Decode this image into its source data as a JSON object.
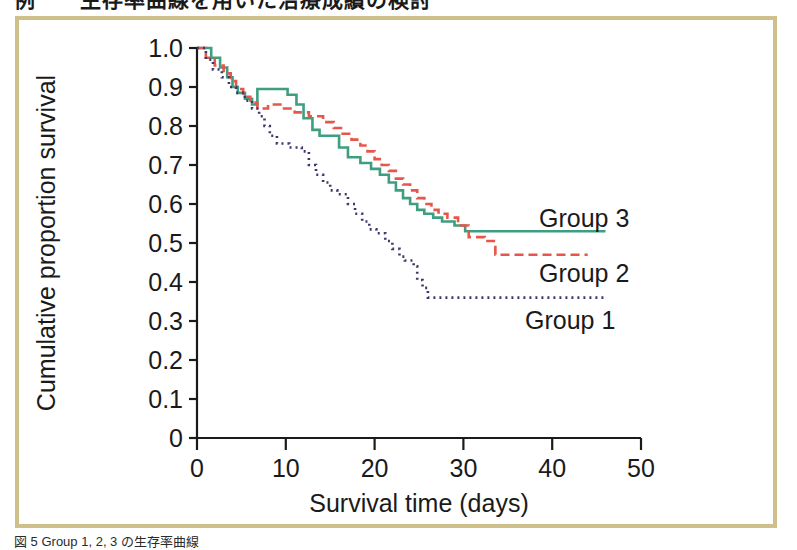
{
  "figure": {
    "top_caption_partial": "例　　生存率曲線を用いた治療成績の検討",
    "bottom_caption_partial": "図 5  Group 1, 2, 3 の生存率曲線",
    "frame_color": "#cfc08b"
  },
  "chart_data": {
    "type": "line",
    "title": "",
    "xlabel": "Survival time (days)",
    "ylabel": "Cumulative proportion survival",
    "xlim": [
      0,
      50
    ],
    "ylim": [
      0,
      1.0
    ],
    "xticks": [
      0,
      10,
      20,
      30,
      40,
      50
    ],
    "xtick_labels": [
      "0",
      "10",
      "20",
      "30",
      "40",
      "50"
    ],
    "yticks": [
      0,
      0.1,
      0.2,
      0.3,
      0.4,
      0.5,
      0.6,
      0.7,
      0.8,
      0.9,
      1.0
    ],
    "ytick_labels": [
      "0",
      "0.1",
      "0.2",
      "0.3",
      "0.4",
      "0.5",
      "0.6",
      "0.7",
      "0.8",
      "0.9",
      "1.0"
    ],
    "grid": false,
    "legend_position": "inline-right",
    "series": [
      {
        "name": "Group 3",
        "label": "Group 3",
        "color": "#3f9e80",
        "style": "solid",
        "stroke_width": 2.6,
        "steps": [
          [
            0.0,
            1.0
          ],
          [
            1.6,
            1.0
          ],
          [
            1.6,
            0.975
          ],
          [
            2.6,
            0.975
          ],
          [
            2.6,
            0.95
          ],
          [
            3.4,
            0.95
          ],
          [
            3.4,
            0.925
          ],
          [
            4.0,
            0.925
          ],
          [
            4.0,
            0.9
          ],
          [
            4.6,
            0.9
          ],
          [
            4.6,
            0.885
          ],
          [
            5.4,
            0.885
          ],
          [
            5.4,
            0.87
          ],
          [
            6.2,
            0.87
          ],
          [
            6.2,
            0.855
          ],
          [
            6.8,
            0.855
          ],
          [
            6.8,
            0.895
          ],
          [
            10.2,
            0.895
          ],
          [
            10.2,
            0.88
          ],
          [
            11.2,
            0.88
          ],
          [
            11.2,
            0.855
          ],
          [
            12.0,
            0.855
          ],
          [
            12.0,
            0.82
          ],
          [
            13.0,
            0.82
          ],
          [
            13.0,
            0.79
          ],
          [
            13.8,
            0.79
          ],
          [
            13.8,
            0.775
          ],
          [
            16.0,
            0.775
          ],
          [
            16.0,
            0.745
          ],
          [
            17.0,
            0.745
          ],
          [
            17.0,
            0.72
          ],
          [
            18.4,
            0.72
          ],
          [
            18.4,
            0.705
          ],
          [
            19.6,
            0.705
          ],
          [
            19.6,
            0.69
          ],
          [
            20.6,
            0.69
          ],
          [
            20.6,
            0.675
          ],
          [
            21.6,
            0.675
          ],
          [
            21.6,
            0.655
          ],
          [
            22.4,
            0.655
          ],
          [
            22.4,
            0.635
          ],
          [
            23.2,
            0.635
          ],
          [
            23.2,
            0.615
          ],
          [
            24.0,
            0.615
          ],
          [
            24.0,
            0.6
          ],
          [
            24.8,
            0.6
          ],
          [
            24.8,
            0.585
          ],
          [
            25.6,
            0.585
          ],
          [
            25.6,
            0.575
          ],
          [
            26.6,
            0.575
          ],
          [
            26.6,
            0.565
          ],
          [
            27.6,
            0.565
          ],
          [
            27.6,
            0.555
          ],
          [
            29.0,
            0.555
          ],
          [
            29.0,
            0.545
          ],
          [
            30.2,
            0.545
          ],
          [
            30.2,
            0.53
          ],
          [
            46.0,
            0.53
          ]
        ],
        "final_value": 0.53,
        "end_x": 46.0
      },
      {
        "name": "Group 2",
        "label": "Group 2",
        "color": "#e8554a",
        "style": "dashed",
        "stroke_width": 2.6,
        "dash_pattern": "9,5",
        "steps": [
          [
            0.0,
            1.0
          ],
          [
            1.0,
            1.0
          ],
          [
            1.0,
            0.975
          ],
          [
            2.0,
            0.975
          ],
          [
            2.0,
            0.955
          ],
          [
            3.0,
            0.955
          ],
          [
            3.0,
            0.935
          ],
          [
            3.8,
            0.935
          ],
          [
            3.8,
            0.915
          ],
          [
            4.4,
            0.915
          ],
          [
            4.4,
            0.895
          ],
          [
            5.2,
            0.895
          ],
          [
            5.2,
            0.875
          ],
          [
            6.0,
            0.875
          ],
          [
            6.0,
            0.86
          ],
          [
            6.8,
            0.86
          ],
          [
            6.8,
            0.845
          ],
          [
            8.0,
            0.845
          ],
          [
            8.0,
            0.855
          ],
          [
            9.6,
            0.855
          ],
          [
            9.6,
            0.845
          ],
          [
            11.0,
            0.845
          ],
          [
            11.0,
            0.835
          ],
          [
            12.6,
            0.835
          ],
          [
            12.6,
            0.825
          ],
          [
            14.2,
            0.825
          ],
          [
            14.2,
            0.81
          ],
          [
            15.4,
            0.81
          ],
          [
            15.4,
            0.795
          ],
          [
            16.4,
            0.795
          ],
          [
            16.4,
            0.78
          ],
          [
            17.4,
            0.78
          ],
          [
            17.4,
            0.765
          ],
          [
            18.4,
            0.765
          ],
          [
            18.4,
            0.75
          ],
          [
            19.2,
            0.75
          ],
          [
            19.2,
            0.735
          ],
          [
            20.0,
            0.735
          ],
          [
            20.0,
            0.715
          ],
          [
            20.8,
            0.715
          ],
          [
            20.8,
            0.7
          ],
          [
            21.6,
            0.7
          ],
          [
            21.6,
            0.685
          ],
          [
            22.4,
            0.685
          ],
          [
            22.4,
            0.665
          ],
          [
            23.2,
            0.665
          ],
          [
            23.2,
            0.65
          ],
          [
            24.0,
            0.65
          ],
          [
            24.0,
            0.635
          ],
          [
            24.8,
            0.635
          ],
          [
            24.8,
            0.615
          ],
          [
            25.6,
            0.615
          ],
          [
            25.6,
            0.6
          ],
          [
            26.4,
            0.6
          ],
          [
            26.4,
            0.585
          ],
          [
            27.2,
            0.585
          ],
          [
            27.2,
            0.575
          ],
          [
            28.2,
            0.575
          ],
          [
            28.2,
            0.565
          ],
          [
            29.4,
            0.565
          ],
          [
            29.4,
            0.545
          ],
          [
            30.6,
            0.545
          ],
          [
            30.6,
            0.515
          ],
          [
            32.4,
            0.515
          ],
          [
            32.4,
            0.505
          ],
          [
            33.6,
            0.505
          ],
          [
            33.6,
            0.47
          ],
          [
            44.0,
            0.47
          ]
        ],
        "final_value": 0.47,
        "end_x": 44.0
      },
      {
        "name": "Group 1",
        "label": "Group 1",
        "color": "#3b3a6b",
        "style": "dotted",
        "stroke_width": 2.6,
        "dash_pattern": "2,4",
        "steps": [
          [
            0.0,
            1.0
          ],
          [
            1.0,
            1.0
          ],
          [
            1.0,
            0.97
          ],
          [
            1.8,
            0.97
          ],
          [
            1.8,
            0.945
          ],
          [
            2.8,
            0.945
          ],
          [
            2.8,
            0.925
          ],
          [
            3.6,
            0.925
          ],
          [
            3.6,
            0.9
          ],
          [
            4.4,
            0.9
          ],
          [
            4.4,
            0.885
          ],
          [
            5.4,
            0.885
          ],
          [
            5.4,
            0.865
          ],
          [
            6.2,
            0.865
          ],
          [
            6.2,
            0.845
          ],
          [
            7.0,
            0.845
          ],
          [
            7.0,
            0.825
          ],
          [
            7.6,
            0.825
          ],
          [
            7.6,
            0.8
          ],
          [
            8.2,
            0.8
          ],
          [
            8.2,
            0.775
          ],
          [
            9.0,
            0.775
          ],
          [
            9.0,
            0.755
          ],
          [
            10.4,
            0.755
          ],
          [
            10.4,
            0.745
          ],
          [
            11.8,
            0.745
          ],
          [
            11.8,
            0.735
          ],
          [
            12.6,
            0.735
          ],
          [
            12.6,
            0.7
          ],
          [
            13.4,
            0.7
          ],
          [
            13.4,
            0.675
          ],
          [
            14.2,
            0.675
          ],
          [
            14.2,
            0.655
          ],
          [
            15.0,
            0.655
          ],
          [
            15.0,
            0.635
          ],
          [
            15.8,
            0.635
          ],
          [
            15.8,
            0.625
          ],
          [
            17.0,
            0.625
          ],
          [
            17.0,
            0.6
          ],
          [
            17.8,
            0.6
          ],
          [
            17.8,
            0.575
          ],
          [
            18.6,
            0.575
          ],
          [
            18.6,
            0.555
          ],
          [
            19.4,
            0.555
          ],
          [
            19.4,
            0.535
          ],
          [
            20.2,
            0.535
          ],
          [
            20.2,
            0.525
          ],
          [
            21.2,
            0.525
          ],
          [
            21.2,
            0.505
          ],
          [
            22.0,
            0.505
          ],
          [
            22.0,
            0.485
          ],
          [
            22.8,
            0.485
          ],
          [
            22.8,
            0.465
          ],
          [
            23.4,
            0.465
          ],
          [
            23.4,
            0.455
          ],
          [
            24.4,
            0.455
          ],
          [
            24.4,
            0.44
          ],
          [
            24.8,
            0.44
          ],
          [
            24.8,
            0.405
          ],
          [
            25.4,
            0.405
          ],
          [
            25.4,
            0.385
          ],
          [
            26.0,
            0.385
          ],
          [
            26.0,
            0.36
          ],
          [
            46.0,
            0.36
          ]
        ],
        "final_value": 0.36,
        "end_x": 46.0
      }
    ],
    "annotations": [
      {
        "text": "Group 3",
        "x": 32.0,
        "y": 0.565
      },
      {
        "text": "Group 2",
        "x": 32.0,
        "y": 0.425
      },
      {
        "text": "Group 1",
        "x": 30.5,
        "y": 0.305
      }
    ]
  }
}
